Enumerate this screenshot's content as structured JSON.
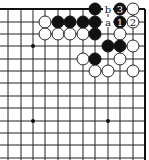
{
  "board": {
    "background": "#ffffff",
    "line_color": "#222222",
    "cols_x": [
      8,
      21,
      33,
      45,
      58,
      70,
      83,
      95,
      108,
      120,
      133,
      145
    ],
    "rows_y": [
      9,
      22,
      34,
      46,
      59,
      71,
      83,
      96,
      108,
      121,
      133,
      145,
      158
    ],
    "edges": [
      "top",
      "right"
    ],
    "star_points": [
      [
        2,
        3
      ],
      [
        2,
        9
      ],
      [
        8,
        9
      ]
    ]
  },
  "stones": [
    {
      "col": 7,
      "row": 0,
      "color": "black"
    },
    {
      "col": 9,
      "row": 0,
      "color": "black",
      "label": "3"
    },
    {
      "col": 10,
      "row": 0,
      "color": "white"
    },
    {
      "col": 3,
      "row": 1,
      "color": "white"
    },
    {
      "col": 4,
      "row": 1,
      "color": "black"
    },
    {
      "col": 5,
      "row": 1,
      "color": "black"
    },
    {
      "col": 6,
      "row": 1,
      "color": "black"
    },
    {
      "col": 7,
      "row": 1,
      "color": "black"
    },
    {
      "col": 9,
      "row": 1,
      "color": "black",
      "label": "1"
    },
    {
      "col": 10,
      "row": 1,
      "color": "white",
      "label": "2"
    },
    {
      "col": 3,
      "row": 2,
      "color": "white"
    },
    {
      "col": 4,
      "row": 2,
      "color": "white"
    },
    {
      "col": 5,
      "row": 2,
      "color": "white"
    },
    {
      "col": 6,
      "row": 2,
      "color": "white"
    },
    {
      "col": 7,
      "row": 2,
      "color": "black"
    },
    {
      "col": 9,
      "row": 2,
      "color": "white"
    },
    {
      "col": 8,
      "row": 3,
      "color": "black"
    },
    {
      "col": 9,
      "row": 3,
      "color": "black"
    },
    {
      "col": 10,
      "row": 3,
      "color": "white"
    },
    {
      "col": 6,
      "row": 4,
      "color": "white"
    },
    {
      "col": 7,
      "row": 4,
      "color": "black"
    },
    {
      "col": 9,
      "row": 4,
      "color": "white"
    },
    {
      "col": 7,
      "row": 5,
      "color": "white"
    },
    {
      "col": 8,
      "row": 5,
      "color": "white"
    },
    {
      "col": 10,
      "row": 5,
      "color": "white"
    }
  ],
  "point_labels": [
    {
      "col": 8,
      "row": 0,
      "text": "b"
    },
    {
      "col": 8,
      "row": 1,
      "text": "a"
    }
  ]
}
